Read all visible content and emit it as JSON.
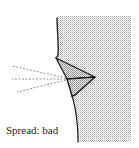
{
  "diagram": {
    "caption": "Spread: bad",
    "colors": {
      "stroke": "#1a1a1a",
      "stipple": "#b8b8b8",
      "dash": "#8a8a8a",
      "background": "#ffffff"
    },
    "elements": [
      {
        "type": "stippled-region",
        "description": "shaded area right of profile line"
      },
      {
        "type": "profile-line",
        "description": "curved body profile outline"
      },
      {
        "type": "upper-triangle",
        "description": "upper shaded triangle"
      },
      {
        "type": "lower-triangle",
        "description": "lower shaded triangle"
      },
      {
        "type": "dashed-rays",
        "count": 3,
        "description": "dashed lines radiating left from tip"
      }
    ]
  }
}
